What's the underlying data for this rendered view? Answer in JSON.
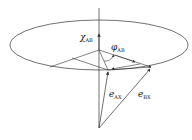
{
  "diagram": {
    "title": "",
    "labels": {
      "chi": {
        "symbol": "χ",
        "subscript": "AB"
      },
      "phi": {
        "symbol": "φ",
        "subscript": "AB"
      },
      "eAX": {
        "symbol": "e",
        "subscript": "AX"
      },
      "eBX": {
        "symbol": "e",
        "subscript": "BX"
      }
    },
    "colors": {
      "stroke": "#333333",
      "background": "#ffffff"
    }
  }
}
